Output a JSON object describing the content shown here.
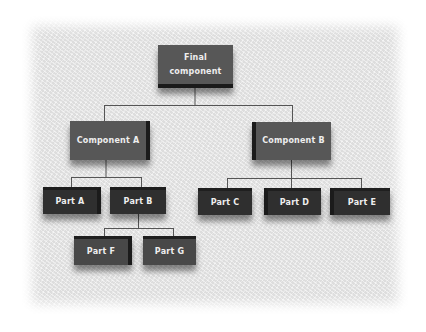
{
  "diagram": {
    "type": "hierarchy-tree",
    "root": {
      "id": "final",
      "label": "Final component",
      "label_lines": [
        "Final",
        "component"
      ],
      "children": [
        "component-a",
        "component-b"
      ]
    },
    "nodes": {
      "component_a": {
        "label": "Component A",
        "children": [
          "part-a",
          "part-b"
        ]
      },
      "component_b": {
        "label": "Component B",
        "children": [
          "part-c",
          "part-d",
          "part-e"
        ]
      },
      "part_a": {
        "label": "Part A"
      },
      "part_b": {
        "label": "Part B",
        "children": [
          "part-f",
          "part-g"
        ]
      },
      "part_c": {
        "label": "Part C"
      },
      "part_d": {
        "label": "Part D"
      },
      "part_e": {
        "label": "Part E"
      },
      "part_f": {
        "label": "Part F"
      },
      "part_g": {
        "label": "Part G"
      }
    },
    "colors": {
      "background": "#e9e9e9",
      "level1_box": "#575757",
      "level2_box": "#575757",
      "level3_box": "#2f2f2f",
      "level4_box": "#484848",
      "text": "#eeeeee",
      "connector": "#555555"
    }
  }
}
